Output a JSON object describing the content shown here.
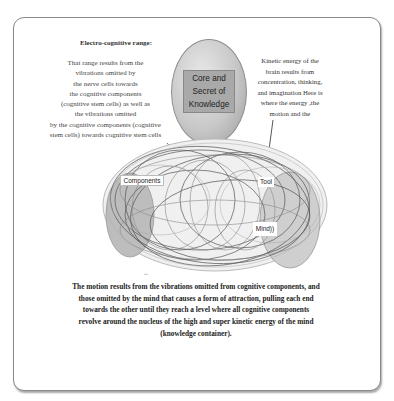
{
  "diagram": {
    "left_note": {
      "title": "Electro-cognitive range:",
      "lines": [
        "That range results from the",
        "vibrations omitted by",
        "the nerve cells towards",
        "the cognitive components",
        "(cognitive stem cells) as well as",
        "the vibrations omitted",
        "by the cognitive components (cognitive",
        "stem cells) towards cognitive stem cells"
      ]
    },
    "center_node": {
      "lines": [
        "Core and",
        "Secret of",
        "Knowledge"
      ]
    },
    "right_note": {
      "lines": [
        "Kinetic energy of the",
        "brain results from",
        "concentration,  thinking,",
        "and imagination  Here is",
        "where the energy ,the",
        "motion and the"
      ]
    },
    "swirl_labels": {
      "components": "Components",
      "tool": "Tool",
      "mind": "Mind))"
    },
    "caption": {
      "lines": [
        "The motion results from the vibrations omitted from cognitive components, and",
        "those omitted by the mind that causes a form of attraction, pulling each end",
        "towards the other until they reach a level where all cognitive components",
        "revolve around the nucleus of the high and super kinetic energy of the mind",
        "(knowledge container)."
      ]
    },
    "colors": {
      "frame_border": "#8a8a8a",
      "oval_fill": "#c8c8c8",
      "label_fill": "#a9a9a9",
      "text": "#333333"
    }
  }
}
